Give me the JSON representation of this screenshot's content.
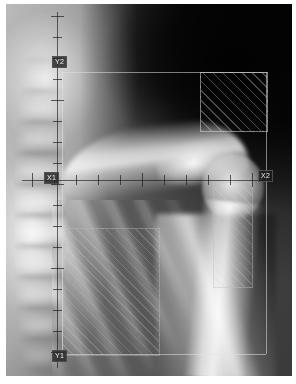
{
  "viewer": {
    "modality_label": "radiograph",
    "background_color": "#ffffff",
    "film_color": "#6a6a6a"
  },
  "annotations": {
    "markers": [
      {
        "id": "marker-left-upper",
        "text": "Y2",
        "x": 52,
        "y": 56
      },
      {
        "id": "marker-left-mid",
        "text": "X1",
        "x": 44,
        "y": 174
      },
      {
        "id": "marker-right-mid",
        "text": "X2",
        "x": 258,
        "y": 172
      },
      {
        "id": "marker-left-lower",
        "text": "Y1",
        "x": 52,
        "y": 352
      }
    ],
    "axes": {
      "vertical_axis_x": 57,
      "horizontal_axis_y": 180,
      "tick_count_vertical": 17,
      "tick_count_horizontal": 11,
      "tick_color": "#1a1a1a"
    },
    "regions": [
      {
        "id": "roi-upper-right",
        "label": "",
        "x": 200,
        "y": 72,
        "w": 66,
        "h": 58
      },
      {
        "id": "roi-lung-field",
        "label": "",
        "x": 62,
        "y": 228,
        "w": 96,
        "h": 126
      },
      {
        "id": "roi-humerus",
        "label": "",
        "x": 213,
        "y": 182,
        "w": 38,
        "h": 104
      },
      {
        "id": "roi-frame-outer",
        "label": "",
        "x": 62,
        "y": 72,
        "w": 204,
        "h": 282
      }
    ]
  }
}
